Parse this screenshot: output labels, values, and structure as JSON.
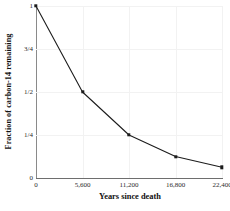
{
  "chart_data": {
    "type": "line",
    "title": "",
    "subtitle": "",
    "xlabel": "Years since death",
    "ylabel": "Fraction of carbon-14 remaining",
    "x": [
      0,
      5600,
      11200,
      16800,
      22400
    ],
    "values": [
      1,
      0.5,
      0.25,
      0.125,
      0.0625
    ],
    "point_labels": [
      "1",
      "1/2",
      "1/4",
      "1/8",
      "1/16"
    ],
    "series": [
      {
        "name": "carbon-14 decay",
        "values": [
          1,
          0.5,
          0.25,
          0.125,
          0.0625
        ]
      }
    ],
    "xlim": [
      0,
      22400
    ],
    "ylim": [
      0,
      1
    ],
    "xticks": [
      0,
      5600,
      11200,
      16800,
      22400
    ],
    "xtick_labels": [
      "0",
      "5,600",
      "11,200",
      "16,800",
      "22,400"
    ],
    "yticks": [
      0,
      0.25,
      0.5,
      0.75,
      1
    ],
    "ytick_labels": [
      "0",
      "1/4",
      "1/2",
      "3/4",
      "1"
    ],
    "grid": true,
    "legend": "none",
    "marker": "square",
    "line_color": "#1c1c1c",
    "marker_color": "#1c1c1c",
    "grid_color": "#f2f2f2",
    "axis_color": "#7a7a7a",
    "background_color": "#ffffff",
    "half_life_years": 5600
  }
}
